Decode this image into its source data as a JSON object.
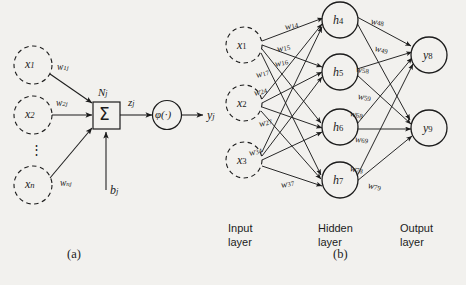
{
  "figure": {
    "background": "#f2f1ee",
    "ink": "#1c1c1c",
    "panel_a": {
      "caption": "(a)",
      "inputs": [
        {
          "name": "x1",
          "label": "x",
          "sub": "1",
          "weight_label": "w",
          "weight_sub": "1j"
        },
        {
          "name": "x2",
          "label": "x",
          "sub": "2",
          "weight_label": "w",
          "weight_sub": "2j"
        },
        {
          "name": "xn",
          "label": "x",
          "sub": "n",
          "weight_label": "w",
          "weight_sub": "nj"
        }
      ],
      "ellipsis": "⋮",
      "neuron_label": "N",
      "neuron_sub": "j",
      "summation_symbol": "Σ",
      "bias_label": "b",
      "bias_sub": "j",
      "net_label": "z",
      "net_sub": "j",
      "activation_label": "φ(·)",
      "output_label": "y",
      "output_sub": "j"
    },
    "panel_b": {
      "caption": "(b)",
      "input_nodes": [
        {
          "name": "x1",
          "label": "x",
          "sub": "1"
        },
        {
          "name": "x2",
          "label": "x",
          "sub": "2"
        },
        {
          "name": "x3",
          "label": "x",
          "sub": "3"
        }
      ],
      "hidden_nodes": [
        {
          "name": "h4",
          "label": "h",
          "sub": "4"
        },
        {
          "name": "h5",
          "label": "h",
          "sub": "5"
        },
        {
          "name": "h6",
          "label": "h",
          "sub": "6"
        },
        {
          "name": "h7",
          "label": "h",
          "sub": "7"
        }
      ],
      "output_nodes": [
        {
          "name": "y8",
          "label": "y",
          "sub": "8"
        },
        {
          "name": "y9",
          "label": "y",
          "sub": "9"
        }
      ],
      "weights": [
        {
          "name": "w14",
          "label": "w",
          "sub": "14",
          "x": 285,
          "y": 22,
          "rot": -12
        },
        {
          "name": "w15",
          "label": "w",
          "sub": "15",
          "x": 277,
          "y": 44,
          "rot": -10
        },
        {
          "name": "w16",
          "label": "w",
          "sub": "16",
          "x": 275,
          "y": 59,
          "rot": -12
        },
        {
          "name": "w17",
          "label": "w",
          "sub": "17",
          "x": 256,
          "y": 70,
          "rot": -14
        },
        {
          "name": "w24",
          "label": "w",
          "sub": "24",
          "x": 254,
          "y": 88,
          "rot": -14
        },
        {
          "name": "w27",
          "label": "w",
          "sub": "27",
          "x": 259,
          "y": 119,
          "rot": -14
        },
        {
          "name": "w34",
          "label": "w",
          "sub": "34",
          "x": 249,
          "y": 148,
          "rot": -14
        },
        {
          "name": "w37",
          "label": "w",
          "sub": "37",
          "x": 281,
          "y": 180,
          "rot": -10
        },
        {
          "name": "w48",
          "label": "w",
          "sub": "48",
          "x": 371,
          "y": 16,
          "rot": 10
        },
        {
          "name": "w49",
          "label": "w",
          "sub": "49",
          "x": 375,
          "y": 43,
          "rot": 14
        },
        {
          "name": "w58",
          "label": "w",
          "sub": "58",
          "x": 356,
          "y": 64,
          "rot": 8
        },
        {
          "name": "w59",
          "label": "w",
          "sub": "59",
          "x": 358,
          "y": 91,
          "rot": 10
        },
        {
          "name": "w68",
          "label": "w",
          "sub": "68",
          "x": 350,
          "y": 108,
          "rot": 12
        },
        {
          "name": "w69",
          "label": "w",
          "sub": "69",
          "x": 355,
          "y": 134,
          "rot": 6
        },
        {
          "name": "w78",
          "label": "w",
          "sub": "78",
          "x": 350,
          "y": 163,
          "rot": 12
        },
        {
          "name": "w79",
          "label": "w",
          "sub": "79",
          "x": 368,
          "y": 180,
          "rot": 12
        }
      ],
      "layer_labels": [
        {
          "name": "input-layer",
          "line1": "Input",
          "line2": "layer",
          "x": 228,
          "y": 222
        },
        {
          "name": "hidden-layer",
          "line1": "Hidden",
          "line2": "layer",
          "x": 318,
          "y": 222
        },
        {
          "name": "output-layer",
          "line1": "Output",
          "line2": "layer",
          "x": 400,
          "y": 222
        }
      ]
    }
  }
}
